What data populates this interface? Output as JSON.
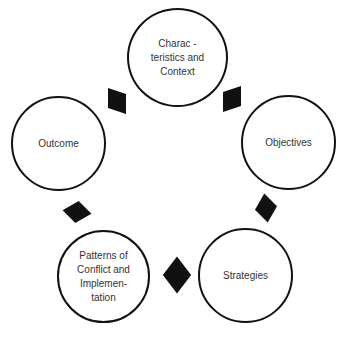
{
  "diagram": {
    "type": "cycle",
    "nodes": [
      {
        "id": "characteristics",
        "label": "Charac -\nteristics and\nContext"
      },
      {
        "id": "objectives",
        "label": "Objectives"
      },
      {
        "id": "strategies",
        "label": "Strategies"
      },
      {
        "id": "patterns",
        "label": "Patterns of\nConflict and\nImplemen-\ntation"
      },
      {
        "id": "outcome",
        "label": "Outcome"
      }
    ],
    "connectors": [
      {
        "from": "characteristics",
        "to": "objectives",
        "shape": "diamond"
      },
      {
        "from": "objectives",
        "to": "strategies",
        "shape": "diamond"
      },
      {
        "from": "strategies",
        "to": "patterns",
        "shape": "diamond"
      },
      {
        "from": "patterns",
        "to": "outcome",
        "shape": "diamond"
      },
      {
        "from": "outcome",
        "to": "characteristics",
        "shape": "diamond"
      }
    ],
    "colors": {
      "stroke": "#111111",
      "fill": "#ffffff",
      "text": "#333333",
      "connector": "#111111"
    }
  }
}
